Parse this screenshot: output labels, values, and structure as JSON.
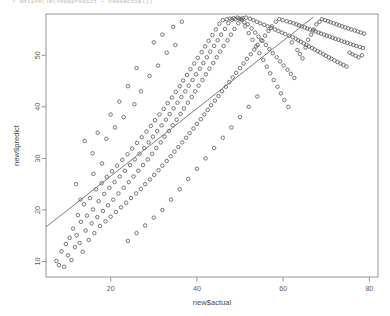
{
  "console": {
    "echo": "> abline(lm(new$predict ~ new$actual))"
  },
  "chart_data": {
    "type": "scatter",
    "title": "",
    "xlabel": "new$actual",
    "ylabel": "new$predict",
    "xlim": [
      5,
      82
    ],
    "ylim": [
      7,
      58
    ],
    "xticks": [
      20,
      40,
      60,
      80
    ],
    "yticks": [
      10,
      20,
      30,
      40,
      50
    ],
    "grid": false,
    "legend": null,
    "marker": "open-circle",
    "marker_color": "#555555",
    "n_points": 300,
    "trendline": {
      "type": "linear-fit",
      "label": "lm(new$predict ~ new$actual)",
      "color": "#6e6e6e",
      "x_start": 5.0,
      "y_start": 16.7,
      "x_end": 67.0,
      "y_end": 57.4
    },
    "points": [
      [
        7.4,
        10.1
      ],
      [
        8.0,
        9.3
      ],
      [
        8.6,
        12.0
      ],
      [
        9.2,
        9.0
      ],
      [
        9.6,
        13.4
      ],
      [
        10.1,
        11.2
      ],
      [
        10.5,
        14.6
      ],
      [
        10.9,
        10.3
      ],
      [
        11.3,
        16.4
      ],
      [
        11.7,
        12.8
      ],
      [
        12.1,
        15.1
      ],
      [
        12.4,
        19.0
      ],
      [
        12.8,
        13.6
      ],
      [
        13.1,
        17.7
      ],
      [
        13.5,
        11.9
      ],
      [
        13.8,
        21.1
      ],
      [
        14.2,
        16.0
      ],
      [
        14.5,
        18.9
      ],
      [
        14.9,
        14.2
      ],
      [
        15.2,
        22.3
      ],
      [
        15.6,
        17.4
      ],
      [
        15.9,
        20.1
      ],
      [
        16.2,
        15.5
      ],
      [
        16.6,
        24.0
      ],
      [
        16.9,
        18.6
      ],
      [
        17.2,
        21.7
      ],
      [
        17.5,
        16.9
      ],
      [
        17.9,
        25.2
      ],
      [
        18.2,
        19.8
      ],
      [
        18.5,
        23.1
      ],
      [
        18.8,
        17.8
      ],
      [
        19.1,
        26.4
      ],
      [
        19.4,
        20.9
      ],
      [
        19.7,
        24.3
      ],
      [
        20.0,
        18.7
      ],
      [
        20.3,
        27.5
      ],
      [
        20.6,
        22.0
      ],
      [
        20.9,
        25.4
      ],
      [
        21.2,
        19.6
      ],
      [
        21.5,
        28.6
      ],
      [
        21.8,
        23.2
      ],
      [
        22.1,
        26.5
      ],
      [
        22.4,
        20.5
      ],
      [
        22.7,
        29.7
      ],
      [
        23.0,
        24.3
      ],
      [
        23.3,
        27.6
      ],
      [
        23.6,
        21.4
      ],
      [
        23.9,
        30.8
      ],
      [
        24.2,
        25.4
      ],
      [
        24.5,
        28.7
      ],
      [
        24.7,
        22.3
      ],
      [
        25.0,
        31.9
      ],
      [
        25.3,
        26.5
      ],
      [
        25.6,
        29.8
      ],
      [
        25.9,
        23.2
      ],
      [
        26.1,
        33.0
      ],
      [
        26.4,
        27.6
      ],
      [
        26.7,
        30.9
      ],
      [
        27.0,
        24.1
      ],
      [
        27.2,
        34.1
      ],
      [
        27.5,
        28.7
      ],
      [
        27.8,
        32.0
      ],
      [
        28.0,
        25.0
      ],
      [
        28.3,
        35.2
      ],
      [
        28.6,
        29.8
      ],
      [
        28.8,
        33.1
      ],
      [
        29.1,
        25.9
      ],
      [
        29.3,
        36.3
      ],
      [
        29.6,
        30.9
      ],
      [
        29.8,
        34.2
      ],
      [
        30.1,
        26.8
      ],
      [
        30.3,
        37.4
      ],
      [
        30.6,
        32.0
      ],
      [
        30.8,
        35.3
      ],
      [
        31.1,
        27.7
      ],
      [
        31.3,
        38.5
      ],
      [
        31.6,
        33.1
      ],
      [
        31.8,
        36.4
      ],
      [
        32.0,
        28.6
      ],
      [
        32.3,
        39.6
      ],
      [
        32.5,
        34.2
      ],
      [
        32.8,
        37.5
      ],
      [
        33.0,
        29.5
      ],
      [
        33.2,
        40.7
      ],
      [
        33.5,
        35.3
      ],
      [
        33.7,
        38.6
      ],
      [
        33.9,
        30.4
      ],
      [
        34.2,
        41.8
      ],
      [
        34.4,
        36.4
      ],
      [
        34.6,
        39.7
      ],
      [
        34.8,
        31.3
      ],
      [
        35.1,
        42.9
      ],
      [
        35.3,
        37.5
      ],
      [
        35.5,
        40.8
      ],
      [
        35.7,
        32.2
      ],
      [
        36.0,
        44.0
      ],
      [
        36.2,
        38.6
      ],
      [
        36.4,
        41.9
      ],
      [
        36.6,
        33.1
      ],
      [
        36.8,
        45.1
      ],
      [
        37.0,
        39.7
      ],
      [
        37.3,
        43.0
      ],
      [
        37.5,
        34.0
      ],
      [
        37.7,
        46.2
      ],
      [
        37.9,
        40.8
      ],
      [
        38.1,
        44.1
      ],
      [
        38.3,
        34.9
      ],
      [
        38.5,
        47.3
      ],
      [
        38.8,
        41.9
      ],
      [
        39.0,
        45.2
      ],
      [
        39.2,
        35.8
      ],
      [
        39.4,
        48.4
      ],
      [
        39.6,
        43.0
      ],
      [
        39.8,
        46.3
      ],
      [
        40.0,
        36.7
      ],
      [
        40.2,
        49.5
      ],
      [
        40.4,
        44.1
      ],
      [
        40.7,
        47.4
      ],
      [
        40.9,
        37.6
      ],
      [
        41.1,
        50.6
      ],
      [
        41.3,
        45.2
      ],
      [
        41.5,
        48.5
      ],
      [
        41.7,
        38.5
      ],
      [
        41.9,
        51.7
      ],
      [
        42.1,
        46.3
      ],
      [
        42.3,
        49.6
      ],
      [
        42.5,
        39.4
      ],
      [
        42.7,
        52.8
      ],
      [
        42.9,
        47.4
      ],
      [
        43.1,
        50.7
      ],
      [
        43.3,
        40.3
      ],
      [
        43.6,
        53.9
      ],
      [
        43.8,
        48.5
      ],
      [
        44.0,
        51.8
      ],
      [
        44.2,
        41.2
      ],
      [
        44.4,
        55.0
      ],
      [
        44.6,
        49.6
      ],
      [
        44.8,
        52.9
      ],
      [
        45.0,
        42.1
      ],
      [
        45.2,
        56.1
      ],
      [
        45.4,
        50.7
      ],
      [
        45.6,
        54.0
      ],
      [
        45.8,
        43.0
      ],
      [
        46.0,
        56.8
      ],
      [
        46.2,
        51.8
      ],
      [
        46.5,
        55.1
      ],
      [
        46.7,
        43.9
      ],
      [
        46.9,
        57.0
      ],
      [
        47.1,
        52.9
      ],
      [
        47.3,
        56.2
      ],
      [
        47.5,
        44.8
      ],
      [
        47.7,
        57.1
      ],
      [
        47.9,
        54.0
      ],
      [
        48.1,
        56.9
      ],
      [
        48.3,
        45.7
      ],
      [
        48.5,
        57.2
      ],
      [
        48.7,
        55.1
      ],
      [
        48.9,
        57.0
      ],
      [
        49.1,
        46.6
      ],
      [
        49.4,
        57.3
      ],
      [
        49.6,
        56.2
      ],
      [
        49.8,
        57.1
      ],
      [
        50.0,
        47.5
      ],
      [
        50.2,
        57.0
      ],
      [
        50.4,
        56.9
      ],
      [
        50.6,
        57.2
      ],
      [
        50.8,
        48.4
      ],
      [
        51.0,
        56.4
      ],
      [
        51.2,
        55.6
      ],
      [
        51.4,
        57.3
      ],
      [
        51.6,
        49.3
      ],
      [
        51.8,
        56.0
      ],
      [
        52.0,
        54.3
      ],
      [
        52.3,
        57.1
      ],
      [
        52.5,
        50.2
      ],
      [
        52.7,
        55.2
      ],
      [
        52.9,
        53.0
      ],
      [
        53.1,
        56.8
      ],
      [
        53.3,
        51.1
      ],
      [
        53.5,
        54.4
      ],
      [
        53.7,
        51.7
      ],
      [
        53.9,
        56.5
      ],
      [
        54.1,
        52.0
      ],
      [
        54.3,
        53.6
      ],
      [
        54.5,
        50.4
      ],
      [
        54.7,
        56.2
      ],
      [
        54.9,
        52.9
      ],
      [
        55.2,
        52.8
      ],
      [
        55.4,
        49.1
      ],
      [
        55.6,
        55.9
      ],
      [
        55.8,
        53.8
      ],
      [
        56.0,
        52.0
      ],
      [
        56.2,
        47.8
      ],
      [
        56.4,
        55.6
      ],
      [
        56.6,
        54.7
      ],
      [
        56.8,
        51.2
      ],
      [
        57.0,
        46.5
      ],
      [
        57.2,
        55.3
      ],
      [
        57.4,
        55.6
      ],
      [
        57.6,
        50.4
      ],
      [
        57.8,
        45.2
      ],
      [
        58.1,
        55.0
      ],
      [
        58.3,
        56.5
      ],
      [
        58.5,
        49.6
      ],
      [
        58.7,
        43.9
      ],
      [
        58.9,
        54.7
      ],
      [
        59.1,
        57.0
      ],
      [
        59.3,
        48.8
      ],
      [
        59.5,
        42.6
      ],
      [
        59.7,
        54.4
      ],
      [
        59.9,
        56.8
      ],
      [
        60.1,
        48.0
      ],
      [
        60.3,
        41.3
      ],
      [
        60.5,
        54.1
      ],
      [
        60.8,
        56.6
      ],
      [
        61.0,
        47.2
      ],
      [
        61.2,
        40.0
      ],
      [
        61.4,
        53.8
      ],
      [
        61.6,
        56.4
      ],
      [
        61.8,
        46.4
      ],
      [
        62.0,
        52.5
      ],
      [
        62.2,
        53.5
      ],
      [
        62.4,
        56.2
      ],
      [
        62.6,
        45.6
      ],
      [
        62.9,
        53.2
      ],
      [
        63.1,
        56.0
      ],
      [
        63.3,
        51.0
      ],
      [
        63.5,
        52.9
      ],
      [
        63.7,
        55.8
      ],
      [
        63.9,
        50.2
      ],
      [
        64.1,
        52.6
      ],
      [
        64.3,
        55.6
      ],
      [
        64.5,
        49.4
      ],
      [
        64.8,
        52.3
      ],
      [
        65.0,
        55.4
      ],
      [
        65.2,
        51.5
      ],
      [
        65.4,
        52.0
      ],
      [
        65.6,
        55.2
      ],
      [
        65.8,
        53.0
      ],
      [
        66.0,
        51.7
      ],
      [
        66.2,
        55.0
      ],
      [
        66.5,
        54.0
      ],
      [
        66.7,
        51.4
      ],
      [
        66.9,
        54.8
      ],
      [
        67.1,
        55.0
      ],
      [
        67.3,
        51.1
      ],
      [
        67.5,
        54.6
      ],
      [
        67.7,
        56.0
      ],
      [
        68.0,
        50.8
      ],
      [
        68.2,
        54.4
      ],
      [
        68.4,
        56.5
      ],
      [
        68.6,
        50.5
      ],
      [
        68.8,
        54.2
      ],
      [
        69.0,
        57.0
      ],
      [
        69.3,
        50.2
      ],
      [
        69.5,
        54.0
      ],
      [
        69.7,
        56.8
      ],
      [
        69.9,
        49.9
      ],
      [
        70.1,
        53.8
      ],
      [
        70.4,
        56.6
      ],
      [
        70.6,
        49.6
      ],
      [
        70.8,
        53.6
      ],
      [
        71.0,
        56.4
      ],
      [
        71.2,
        49.3
      ],
      [
        71.5,
        53.4
      ],
      [
        71.7,
        56.2
      ],
      [
        71.9,
        49.0
      ],
      [
        72.1,
        53.2
      ],
      [
        72.4,
        56.0
      ],
      [
        72.6,
        48.7
      ],
      [
        72.8,
        53.0
      ],
      [
        73.0,
        55.8
      ],
      [
        73.3,
        48.4
      ],
      [
        73.5,
        52.8
      ],
      [
        73.7,
        55.6
      ],
      [
        74.0,
        48.1
      ],
      [
        74.2,
        52.6
      ],
      [
        74.4,
        55.4
      ],
      [
        74.7,
        47.8
      ],
      [
        74.9,
        52.4
      ],
      [
        75.1,
        55.2
      ],
      [
        75.4,
        50.5
      ],
      [
        75.6,
        52.2
      ],
      [
        75.8,
        55.0
      ],
      [
        76.1,
        50.2
      ],
      [
        76.3,
        52.0
      ],
      [
        76.6,
        54.8
      ],
      [
        76.8,
        49.9
      ],
      [
        77.0,
        51.8
      ],
      [
        77.3,
        54.6
      ],
      [
        77.5,
        49.6
      ],
      [
        77.8,
        51.6
      ],
      [
        78.0,
        54.4
      ],
      [
        78.3,
        50.0
      ],
      [
        78.5,
        51.4
      ],
      [
        78.8,
        54.2
      ],
      [
        14.0,
        33.4
      ],
      [
        15.8,
        31.0
      ],
      [
        17.0,
        35.0
      ],
      [
        19.0,
        33.8
      ],
      [
        21.0,
        36.0
      ],
      [
        23.0,
        38.0
      ],
      [
        25.5,
        40.5
      ],
      [
        27.0,
        43.0
      ],
      [
        29.0,
        46.0
      ],
      [
        31.0,
        48.0
      ],
      [
        33.0,
        50.5
      ],
      [
        35.0,
        52.0
      ],
      [
        24.0,
        44.0
      ],
      [
        26.0,
        47.5
      ],
      [
        22.0,
        41.0
      ],
      [
        20.0,
        38.5
      ],
      [
        30.0,
        52.5
      ],
      [
        32.0,
        54.0
      ],
      [
        34.5,
        55.5
      ],
      [
        36.5,
        56.5
      ],
      [
        12.0,
        25.0
      ],
      [
        13.0,
        22.0
      ],
      [
        16.0,
        27.0
      ],
      [
        18.0,
        29.0
      ],
      [
        40.0,
        28.0
      ],
      [
        42.0,
        30.0
      ],
      [
        44.0,
        32.0
      ],
      [
        46.0,
        34.0
      ],
      [
        48.0,
        36.0
      ],
      [
        50.0,
        38.0
      ],
      [
        52.0,
        40.0
      ],
      [
        54.0,
        42.0
      ],
      [
        38.0,
        26.0
      ],
      [
        36.0,
        24.0
      ],
      [
        34.0,
        22.0
      ],
      [
        32.0,
        20.0
      ],
      [
        30.0,
        18.5
      ],
      [
        28.0,
        17.0
      ],
      [
        26.0,
        15.5
      ],
      [
        24.0,
        14.0
      ]
    ]
  }
}
